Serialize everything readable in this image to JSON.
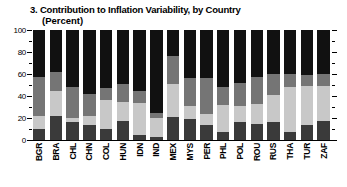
{
  "chart_data": {
    "type": "bar",
    "stacked": true,
    "title": "3. Contribution to Inflation Variability, by Country",
    "subtitle": "(Percent)",
    "xlabel": "",
    "ylabel": "",
    "ylim": [
      0,
      100
    ],
    "yticks": [
      0,
      20,
      40,
      60,
      80,
      100
    ],
    "ytick_labels": [
      "0",
      "20",
      "40",
      "60",
      "80",
      "100"
    ],
    "yminor_ticks": [
      10,
      30,
      50,
      70,
      90
    ],
    "grid": false,
    "legend": "none",
    "categories": [
      "BGR",
      "BRA",
      "CHL",
      "CHN",
      "COL",
      "HUN",
      "IDN",
      "IND",
      "MEX",
      "MYS",
      "PER",
      "PHL",
      "POL",
      "ROU",
      "RUS",
      "THA",
      "TUR",
      "ZAF"
    ],
    "series": [
      {
        "name": "series-1",
        "color": "#3a3a3a",
        "values": [
          10,
          22,
          16,
          14,
          10,
          17,
          5,
          3,
          21,
          19,
          14,
          7,
          16,
          15,
          16,
          7,
          14,
          17
        ]
      },
      {
        "name": "series-2",
        "color": "#c8c8c8",
        "values": [
          12,
          23,
          4,
          8,
          26,
          18,
          29,
          17,
          30,
          12,
          10,
          25,
          15,
          18,
          25,
          41,
          35,
          32
        ]
      },
      {
        "name": "series-3",
        "color": "#757575",
        "values": [
          35,
          17,
          28,
          20,
          11,
          16,
          11,
          5,
          25,
          25,
          32,
          16,
          21,
          24,
          19,
          12,
          10,
          11
        ]
      },
      {
        "name": "series-4",
        "color": "#111111",
        "values": [
          43,
          38,
          52,
          58,
          53,
          49,
          55,
          75,
          24,
          44,
          44,
          52,
          48,
          43,
          40,
          40,
          41,
          40
        ]
      }
    ]
  }
}
